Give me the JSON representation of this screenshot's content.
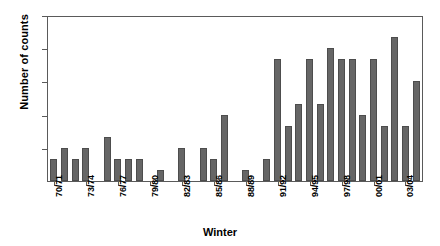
{
  "chart_data": {
    "type": "bar",
    "title": "",
    "xlabel": "Winter",
    "ylabel": "Number of counts",
    "ylim": [
      0,
      15
    ],
    "yticks": [
      0,
      3,
      6,
      9,
      12,
      15
    ],
    "grid": false,
    "legend": null,
    "categories": [
      "70/71",
      "71/72",
      "72/73",
      "73/74",
      "74/75",
      "75/76",
      "76/77",
      "77/78",
      "78/79",
      "79/80",
      "80/81",
      "81/82",
      "82/83",
      "83/84",
      "84/85",
      "85/86",
      "86/87",
      "87/88",
      "88/89",
      "89/90",
      "90/91",
      "91/92",
      "92/93",
      "93/94",
      "94/95",
      "95/96",
      "96/97",
      "97/98",
      "98/99",
      "99/00",
      "00/01",
      "01/02",
      "02/03",
      "03/04",
      "04/05"
    ],
    "values": [
      2,
      3,
      2,
      3,
      0,
      4,
      2,
      2,
      2,
      0,
      1,
      0,
      3,
      0,
      3,
      2,
      6,
      0,
      1,
      0,
      2,
      11,
      5,
      7,
      11,
      7,
      12,
      11,
      11,
      6,
      11,
      5,
      13,
      5,
      9
    ],
    "tick_label_every": 3,
    "visible_tick_labels": [
      "70/71",
      "73/74",
      "76/77",
      "79/80",
      "82/83",
      "85/86",
      "88/89",
      "91/92",
      "94/95",
      "97/98",
      "00/01",
      "03/04"
    ],
    "bar_color": "#666666",
    "axis_color": "#5a5a5a",
    "background_color": "#ffffff"
  }
}
